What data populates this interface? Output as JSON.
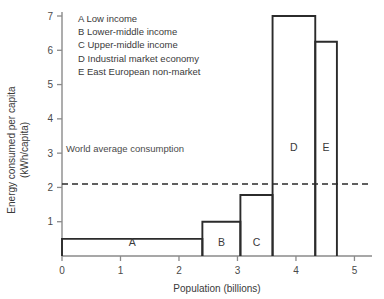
{
  "chart_data": {
    "type": "bar",
    "title": "",
    "xlabel": "Population (billions)",
    "ylabel_line1": "Energy consumed per capita",
    "ylabel_line2": "(kWh/capita)",
    "xlim": [
      0,
      5.3
    ],
    "ylim": [
      0,
      7.3
    ],
    "xticks": [
      0,
      1,
      2,
      3,
      4,
      5
    ],
    "xticklabels": [
      "0",
      "1",
      "2",
      "3",
      "4",
      "5"
    ],
    "yticks": [
      1,
      2,
      3,
      4,
      5,
      6,
      7
    ],
    "yticklabels": [
      "1",
      "2",
      "3",
      "4",
      "5",
      "6",
      "7"
    ],
    "grid": false,
    "legend_position": "upper-center-inside",
    "bars": [
      {
        "label": "A",
        "x_start": 0.0,
        "x_end": 2.4,
        "value": 0.5,
        "legend": "A Low income"
      },
      {
        "label": "B",
        "x_start": 2.4,
        "x_end": 3.05,
        "value": 1.0,
        "legend": "B Lower-middle income"
      },
      {
        "label": "C",
        "x_start": 3.05,
        "x_end": 3.6,
        "value": 1.78,
        "legend": "C Upper-middle income"
      },
      {
        "label": "D",
        "x_start": 3.6,
        "x_end": 4.33,
        "value": 7.0,
        "legend": "D Industrial market economy"
      },
      {
        "label": "E",
        "x_start": 4.33,
        "x_end": 4.7,
        "value": 6.25,
        "legend": "E East European non-market"
      }
    ],
    "reference_line": {
      "value": 2.1,
      "style": "dashed",
      "annotation": "World average consumption"
    }
  },
  "legend": {
    "entries": [
      "A Low income",
      "B Lower-middle income",
      "C Upper-middle income",
      "D Industrial market economy",
      "E East European non-market"
    ]
  },
  "colors": {
    "bar_stroke": "#2b2b2b",
    "axis": "#8a8a8a",
    "text": "#3a3a3a",
    "reference_line": "#2b2b2b",
    "background": "#ffffff"
  }
}
